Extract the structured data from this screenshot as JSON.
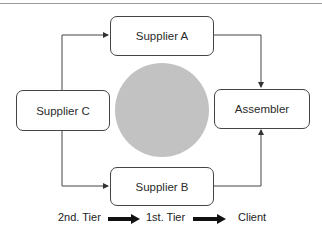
{
  "diagram": {
    "nodes": {
      "supplier_a": "Supplier A",
      "supplier_b": "Supplier B",
      "supplier_c": "Supplier C",
      "assembler": "Assembler"
    },
    "edges": [
      {
        "from": "Supplier C",
        "to": "Supplier A"
      },
      {
        "from": "Supplier C",
        "to": "Supplier B"
      },
      {
        "from": "Supplier A",
        "to": "Assembler"
      },
      {
        "from": "Supplier B",
        "to": "Assembler"
      }
    ],
    "center_circle_color": "#c2c2c2"
  },
  "legend": {
    "tier2": "2nd. Tier",
    "tier1": "1st. Tier",
    "client": "Client"
  }
}
